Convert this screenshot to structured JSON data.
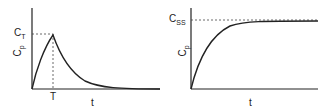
{
  "panels": [
    {
      "id": "left",
      "y_label": {
        "main": "C",
        "sub": "p"
      },
      "level_label": {
        "main": "C",
        "sub": "T"
      },
      "x_marker": "T",
      "x_label": "t",
      "curve": "rise to peak at T then exponential decay"
    },
    {
      "id": "right",
      "y_label": {
        "main": "C",
        "sub": "p"
      },
      "level_label": {
        "main": "C",
        "sub": "SS"
      },
      "x_label": "t",
      "curve": "exponential rise to steady state"
    }
  ],
  "colors": {
    "line": "#222222",
    "dash": "#444444"
  }
}
